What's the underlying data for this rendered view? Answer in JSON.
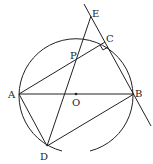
{
  "diagram": {
    "labels": {
      "A": "A",
      "B": "B",
      "C": "C",
      "D": "D",
      "E": "E",
      "O": "O",
      "P": "P"
    },
    "colors": {
      "stroke": "#222222",
      "background": "#ffffff"
    }
  }
}
